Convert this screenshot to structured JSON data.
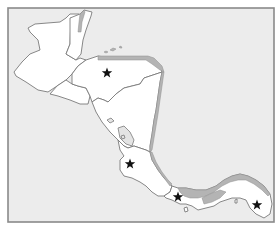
{
  "map": {
    "region": "Central America",
    "colors": {
      "sea": "#ececec",
      "land": "#ffffff",
      "shaded_land": "#b4b4b4",
      "border": "#7a7a7a",
      "frame": "#8a8a8a",
      "star": "#111111"
    },
    "markers": [
      {
        "id": "star-honduras",
        "icon": "star-icon",
        "x": 107,
        "y": 73
      },
      {
        "id": "star-costa-rica",
        "icon": "star-icon",
        "x": 130,
        "y": 164
      },
      {
        "id": "star-panama-west",
        "icon": "star-icon",
        "x": 178,
        "y": 197
      },
      {
        "id": "star-panama-east",
        "icon": "star-icon",
        "x": 257,
        "y": 205
      }
    ]
  }
}
